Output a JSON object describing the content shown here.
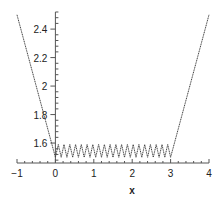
{
  "chart_data": {
    "type": "line",
    "title": "",
    "xlabel": "x",
    "ylabel": "",
    "xlim": [
      -1,
      4
    ],
    "ylim": [
      1.46,
      2.52
    ],
    "x_axis_crosses_y_at": 1.46,
    "y_axis_crosses_x_at": 0,
    "x_ticks": [
      -1,
      0,
      1,
      2,
      3,
      4
    ],
    "x_tick_labels": [
      "−1",
      "0",
      "1",
      "2",
      "3",
      "4"
    ],
    "x_minor_step": 0.2,
    "y_ticks": [
      1.6,
      1.8,
      2.0,
      2.2,
      2.4
    ],
    "y_tick_labels": [
      "1.6",
      "1.8",
      "2",
      "2.2",
      "2.4"
    ],
    "y_minor_step": 0.04,
    "grid": false,
    "legend": "none",
    "series": [
      {
        "name": "piecewise curve",
        "description": "y = 1.5 - x on [-1,0]; zigzag between 1.5 and 1.59 on [0,3] with about 20 oscillations; y = x - 1.5 on [3,4]",
        "segments": [
          {
            "kind": "linear",
            "x": [
              -1,
              0
            ],
            "y": [
              2.5,
              1.5
            ]
          },
          {
            "kind": "zigzag",
            "x_range": [
              0,
              3
            ],
            "y_min": 1.5,
            "y_max": 1.59,
            "cycles": 20
          },
          {
            "kind": "linear",
            "x": [
              3,
              4
            ],
            "y": [
              1.5,
              2.5
            ]
          }
        ]
      }
    ]
  }
}
